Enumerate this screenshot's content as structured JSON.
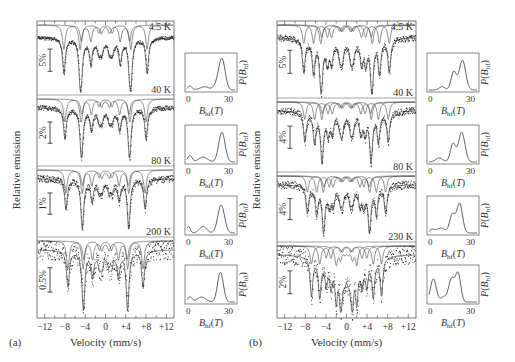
{
  "chart_data": [
    {
      "type": "line",
      "panel_label": "(a)",
      "title": "",
      "xlabel": "Velocity (mm/s)",
      "ylabel": "Relative emission",
      "xlim": [
        -13.5,
        13.5
      ],
      "xticks": [
        -12,
        -8,
        -4,
        0,
        4,
        8,
        12
      ],
      "xtick_labels": [
        "−12",
        "−8",
        "−4",
        "0",
        "+4",
        "+8",
        "+12"
      ],
      "grid": false,
      "frame": {
        "x": 37,
        "y": 21,
        "w": 137,
        "h": 297
      },
      "spectra": [
        {
          "temperature": "4.5 K",
          "scale_bar": "5%",
          "top": 21,
          "height": 74,
          "sextet_split": [
            8.2,
            5.0
          ],
          "depth": 0.62,
          "noise": 0.006
        },
        {
          "temperature": "40 K",
          "scale_bar": "2%",
          "top": 95,
          "height": 71,
          "sextet_split": [
            8.0,
            4.8
          ],
          "depth": 0.62,
          "noise": 0.008
        },
        {
          "temperature": "80 K",
          "scale_bar": "1%",
          "top": 166,
          "height": 71,
          "sextet_split": [
            7.8,
            4.6
          ],
          "depth": 0.62,
          "noise": 0.012
        },
        {
          "temperature": "200 K",
          "scale_bar": "0.5%",
          "top": 237,
          "height": 81,
          "sextet_split": [
            7.4,
            4.4
          ],
          "depth": 0.62,
          "noise": 0.03
        }
      ],
      "insets": [
        {
          "y": 53,
          "xlabel": "B_hf(T)",
          "ylabel": "P(B_hf)",
          "xticks": [
            "0",
            "30"
          ],
          "peaks": [
            [
              24,
              0.95,
              2.2
            ],
            [
              12,
              0.1,
              3
            ],
            [
              20,
              0.12,
              2
            ],
            [
              2,
              0.12,
              1.5
            ]
          ]
        },
        {
          "y": 125,
          "xlabel": "B_hf(T)",
          "ylabel": "P(B_hf)",
          "xticks": [
            "0",
            "30"
          ],
          "peaks": [
            [
              24,
              0.9,
              2.2
            ],
            [
              11,
              0.15,
              3
            ],
            [
              2,
              0.2,
              1.5
            ]
          ]
        },
        {
          "y": 196,
          "xlabel": "B_hf(T)",
          "ylabel": "P(B_hf)",
          "xticks": [
            "0",
            "30"
          ],
          "peaks": [
            [
              23.5,
              0.85,
              2.3
            ],
            [
              11,
              0.2,
              2.5
            ],
            [
              1,
              0.2,
              1.2
            ]
          ]
        },
        {
          "y": 265,
          "xlabel": "B_hf(T)",
          "ylabel": "P(B_hf)",
          "xticks": [
            "0",
            "30"
          ],
          "peaks": [
            [
              23,
              0.9,
              2
            ],
            [
              10,
              0.15,
              3
            ],
            [
              2,
              0.15,
              1.5
            ]
          ]
        }
      ]
    },
    {
      "type": "line",
      "panel_label": "(b)",
      "title": "",
      "xlabel": "Velocity (mm/s)",
      "ylabel": "Relative emission",
      "xlim": [
        -13.5,
        13.5
      ],
      "xticks": [
        -12,
        -8,
        -4,
        0,
        4,
        8,
        12
      ],
      "xtick_labels": [
        "−12",
        "−8",
        "−4",
        "0",
        "+4",
        "+8",
        "+12"
      ],
      "grid": false,
      "frame": {
        "x": 277,
        "y": 21,
        "w": 139,
        "h": 297
      },
      "spectra": [
        {
          "temperature": "4.5 K",
          "scale_bar": "5%",
          "top": 21,
          "height": 77,
          "sextet_split": [
            8.3,
            6.4,
            5.0
          ],
          "depth": 0.62,
          "noise": 0.01
        },
        {
          "temperature": "40 K",
          "scale_bar": "4%",
          "top": 98,
          "height": 74,
          "sextet_split": [
            8.1,
            6.2,
            4.8
          ],
          "depth": 0.62,
          "noise": 0.012
        },
        {
          "temperature": "80 K",
          "scale_bar": "4%",
          "top": 172,
          "height": 70,
          "sextet_split": [
            7.6,
            5.8,
            4.5
          ],
          "depth": 0.62,
          "noise": 0.014
        },
        {
          "temperature": "230 K",
          "scale_bar": "2%",
          "top": 242,
          "height": 76,
          "sextet_split": [
            6.8,
            5.2,
            2.0
          ],
          "depth": 0.62,
          "noise": 0.03
        }
      ],
      "insets": [
        {
          "y": 53,
          "xlabel": "B_hf(T)",
          "ylabel": "P(B_hf)",
          "xticks": [
            "0",
            "30"
          ],
          "peaks": [
            [
              23,
              0.9,
              2.2
            ],
            [
              17,
              0.55,
              1.8
            ],
            [
              9,
              0.1,
              2
            ]
          ]
        },
        {
          "y": 125,
          "xlabel": "B_hf(T)",
          "ylabel": "P(B_hf)",
          "xticks": [
            "0",
            "30"
          ],
          "peaks": [
            [
              22.5,
              0.9,
              2.2
            ],
            [
              16.5,
              0.55,
              1.8
            ],
            [
              7,
              0.12,
              2.5
            ]
          ]
        },
        {
          "y": 196,
          "xlabel": "B_hf(T)",
          "ylabel": "P(B_hf)",
          "xticks": [
            "0",
            "30"
          ],
          "peaks": [
            [
              21,
              0.9,
              2
            ],
            [
              16,
              0.55,
              1.8
            ],
            [
              8,
              0.15,
              3
            ],
            [
              2,
              0.1,
              1.5
            ]
          ]
        },
        {
          "y": 265,
          "xlabel": "B_hf(T)",
          "ylabel": "P(B_hf)",
          "xticks": [
            "0",
            "30"
          ],
          "peaks": [
            [
              20,
              0.85,
              1.8
            ],
            [
              15.5,
              0.7,
              2
            ],
            [
              3,
              0.7,
              2
            ],
            [
              10,
              0.15,
              2
            ]
          ]
        }
      ]
    }
  ]
}
